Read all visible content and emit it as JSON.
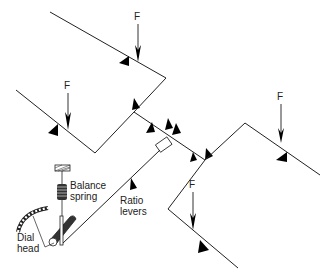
{
  "diagram": {
    "type": "mechanical-lever-weighing-system",
    "labels": {
      "force": "F",
      "balance_spring_line1": "Balance",
      "balance_spring_line2": "spring",
      "ratio_levers_line1": "Ratio",
      "ratio_levers_line2": "levers",
      "dial_head_line1": "Dial",
      "dial_head_line2": "head"
    },
    "forces": [
      {
        "id": "f1",
        "label": "F",
        "position": "top-left lever"
      },
      {
        "id": "f2",
        "label": "F",
        "position": "second-left lever"
      },
      {
        "id": "f3",
        "label": "F",
        "position": "right lever"
      },
      {
        "id": "f4",
        "label": "F",
        "position": "bottom lever"
      }
    ],
    "colors": {
      "line": "#222222",
      "fill": "#000000",
      "background": "#ffffff"
    }
  }
}
